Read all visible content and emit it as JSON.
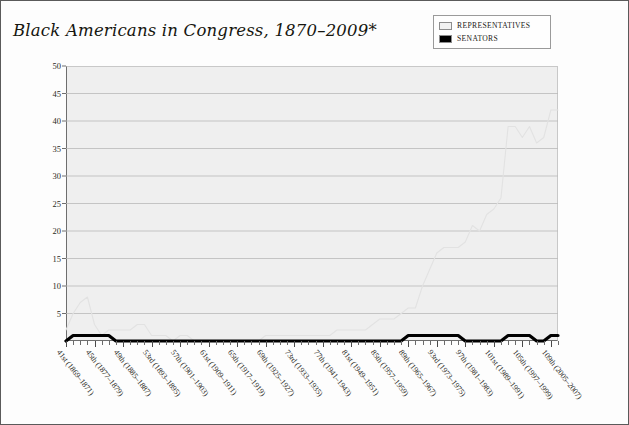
{
  "title": "Black Americans in Congress, 1870–2009*",
  "legend": {
    "position": "top-right",
    "items": [
      {
        "label": "Representatives",
        "swatch": "#f2f2f2",
        "name": "representatives"
      },
      {
        "label": "Senators",
        "swatch": "#000000",
        "name": "senators"
      }
    ]
  },
  "colors": {
    "plot_background": "#efefef",
    "gridline": "#b9b9b9",
    "axis": "#6e6e6e",
    "representatives_line": "#e2e2e2",
    "senators_line": "#000000",
    "text": "#1b1b17",
    "border": "#5a5a5a"
  },
  "chart_data": {
    "type": "line",
    "title": "Black Americans in Congress, 1870–2009*",
    "xlabel": "",
    "ylabel": "",
    "ylim": [
      0,
      50
    ],
    "ytick_step": 5,
    "ytick_labels": [
      "50",
      "45",
      "40",
      "35",
      "30",
      "25",
      "20",
      "15",
      "10",
      "5"
    ],
    "yticks": [
      50,
      45,
      40,
      35,
      30,
      25,
      20,
      15,
      10,
      5
    ],
    "grid": true,
    "legend_position": "top-right",
    "categories": [
      "41st (1869–1871)",
      "42nd (1871–1873)",
      "43rd (1873–1875)",
      "44th (1875–1877)",
      "45th (1877–1879)",
      "46th (1879–1881)",
      "47th (1881–1883)",
      "48th (1883–1885)",
      "49th (1885–1887)",
      "50th (1887–1889)",
      "51st (1889–1891)",
      "52nd (1891–1893)",
      "53rd (1893–1895)",
      "54th (1895–1897)",
      "55th (1897–1899)",
      "56th (1899–1901)",
      "57th (1901–1903)",
      "58th (1903–1905)",
      "59th (1905–1907)",
      "60th (1907–1909)",
      "61st (1909–1911)",
      "62nd (1911–1913)",
      "63rd (1913–1915)",
      "64th (1915–1917)",
      "65th (1917–1919)",
      "66th (1919–1921)",
      "67th (1921–1923)",
      "68th (1923–1925)",
      "69th (1925–1927)",
      "70th (1927–1929)",
      "71st (1929–1931)",
      "72nd (1931–1933)",
      "73rd (1933–1935)",
      "74th (1935–1937)",
      "75th (1937–1939)",
      "76th (1939–1941)",
      "77th (1941–1943)",
      "78th (1943–1945)",
      "79th (1945–1947)",
      "80th (1947–1949)",
      "81st (1949–1951)",
      "82nd (1951–1953)",
      "83rd (1953–1955)",
      "84th (1955–1957)",
      "85th (1957–1959)",
      "86th (1959–1961)",
      "87th (1961–1963)",
      "88th (1963–1965)",
      "89th (1965–1967)",
      "90th (1967–1969)",
      "91st (1969–1971)",
      "92nd (1971–1973)",
      "93rd (1973–1975)",
      "94th (1975–1977)",
      "95th (1977–1979)",
      "96th (1979–1981)",
      "97th (1981–1983)",
      "98th (1983–1985)",
      "99th (1985–1987)",
      "100th (1987–1989)",
      "101st (1989–1991)",
      "102nd (1991–1993)",
      "103rd (1993–1995)",
      "104th (1995–1997)",
      "105th (1997–1999)",
      "106th (1999–2001)",
      "107th (2001–2003)",
      "108th (2003–2005)",
      "109th (2005–2007)",
      "110th (2007–2009)"
    ],
    "xtick_labels_shown": [
      "41st (1869–1871)",
      "45th (1877–1879)",
      "49th (1885–1887)",
      "53rd (1893–1895)",
      "57th (1901–1903)",
      "61st (1909–1911)",
      "65th (1917–1919)",
      "69th (1925–1927)",
      "73rd (1933–1935)",
      "77th (1941–1943)",
      "81st (1949–1951)",
      "85th (1957–1959)",
      "89th (1965–1967)",
      "93rd (1973–1975)",
      "97th (1981–1983)",
      "101st (1989–1991)",
      "105th (1997–1999)",
      "109th (2005–2007)"
    ],
    "series": [
      {
        "name": "Representatives",
        "color": "#e2e2e2",
        "values": [
          2,
          5,
          7,
          8,
          3,
          1,
          2,
          2,
          2,
          2,
          3,
          3,
          1,
          1,
          1,
          0,
          1,
          1,
          0,
          0,
          0,
          0,
          0,
          0,
          0,
          0,
          0,
          0,
          1,
          1,
          1,
          1,
          1,
          1,
          1,
          1,
          1,
          1,
          2,
          2,
          2,
          2,
          2,
          3,
          4,
          4,
          4,
          5,
          6,
          6,
          10,
          13,
          16,
          17,
          17,
          17,
          18,
          21,
          20,
          23,
          24,
          26,
          39,
          39,
          37,
          39,
          36,
          37,
          42,
          42
        ]
      },
      {
        "name": "Senators",
        "color": "#000000",
        "values": [
          0,
          1,
          1,
          1,
          1,
          1,
          1,
          0,
          0,
          0,
          0,
          0,
          0,
          0,
          0,
          0,
          0,
          0,
          0,
          0,
          0,
          0,
          0,
          0,
          0,
          0,
          0,
          0,
          0,
          0,
          0,
          0,
          0,
          0,
          0,
          0,
          0,
          0,
          0,
          0,
          0,
          0,
          0,
          0,
          0,
          0,
          0,
          0,
          1,
          1,
          1,
          1,
          1,
          1,
          1,
          1,
          0,
          0,
          0,
          0,
          0,
          0,
          1,
          1,
          1,
          1,
          0,
          0,
          1,
          1
        ]
      }
    ]
  }
}
